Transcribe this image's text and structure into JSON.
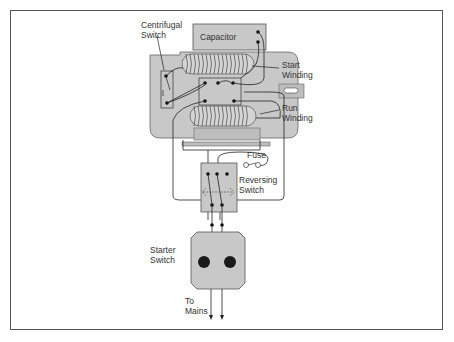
{
  "diagram": {
    "type": "motor-wiring-diagram",
    "labels": {
      "centrifugal_switch": [
        "Centrifugal",
        "Switch"
      ],
      "capacitor": "Capacitor",
      "start_winding": [
        "Start",
        "Winding"
      ],
      "run_winding": [
        "Run",
        "Winding"
      ],
      "fuse": "Fuse",
      "reversing_switch": [
        "Reversing",
        "Switch"
      ],
      "starter_switch": [
        "Starter",
        "Switch"
      ],
      "to_mains": [
        "To",
        "Mains"
      ]
    },
    "colors": {
      "housing": "#c8c8c8",
      "component_fill": "#bdbdbd",
      "wire": "#222222",
      "frame": "#555555",
      "button": "#1a1a1a"
    }
  }
}
